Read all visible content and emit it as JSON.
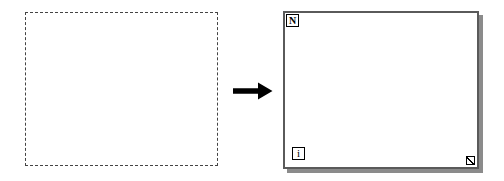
{
  "diagram": {
    "background_color": "#ffffff",
    "before": {
      "label": "",
      "shape_name": "dashed-selection-rectangle",
      "border_style": "dashed",
      "border_color": "#444444",
      "fill_color": "#ffffff"
    },
    "arrow": {
      "label": "",
      "direction": "right",
      "color": "#000000"
    },
    "after": {
      "label": "",
      "shape_name": "for-loop-structure",
      "border_color": "#5a5a5a",
      "shadow_color": "#8b8b8b",
      "fill_color": "#ffffff",
      "count_terminal_label": "N",
      "iteration_terminal_label": "i",
      "resize_handle_label": ""
    }
  }
}
